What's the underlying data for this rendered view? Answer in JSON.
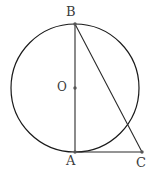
{
  "figure": {
    "kind": "geometry-diagram",
    "canvas": {
      "width": 155,
      "height": 192,
      "background": "#ffffff"
    },
    "style": {
      "stroke_color": "#2b2b2b",
      "circle_stroke_color": "#1a1a1a",
      "stroke_width": 1.1,
      "circle_stroke_width": 1.2,
      "label_color": "#3b3b3b",
      "point_marker_color": "#555555",
      "point_marker_radius": 1.7
    },
    "circle": {
      "name": "circle-O",
      "center": {
        "x": 75,
        "y": 88
      },
      "radius": 64
    },
    "points": [
      {
        "id": "B",
        "label": "B",
        "x": 75,
        "y": 24,
        "marker": true
      },
      {
        "id": "O",
        "label": "O",
        "x": 75,
        "y": 88,
        "marker": true
      },
      {
        "id": "A",
        "label": "A",
        "x": 75,
        "y": 152,
        "marker": true
      },
      {
        "id": "C",
        "label": "C",
        "x": 142,
        "y": 152,
        "marker": true
      }
    ],
    "segments": [
      {
        "id": "AB",
        "label": "AB",
        "from": "B",
        "to": "A",
        "x1": 75,
        "y1": 24,
        "x2": 75,
        "y2": 152
      },
      {
        "id": "BC",
        "label": "BC",
        "from": "B",
        "to": "C",
        "x1": 75,
        "y1": 24,
        "x2": 142,
        "y2": 152
      },
      {
        "id": "AC",
        "label": "AC",
        "from": "A",
        "to": "C",
        "x1": 75,
        "y1": 152,
        "x2": 142,
        "y2": 152
      }
    ],
    "labels": {
      "B": "B",
      "A": "A",
      "C": "C",
      "O": "O"
    }
  }
}
